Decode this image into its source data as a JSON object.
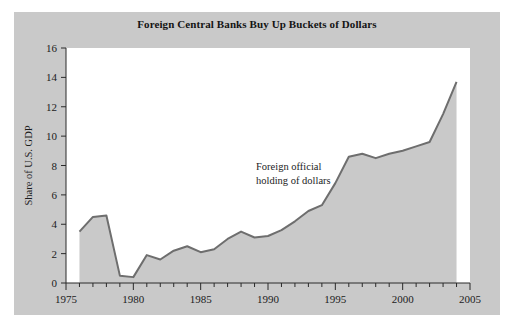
{
  "panel": {
    "background_color": "#c9c9c9",
    "plot_background_color": "#ffffff"
  },
  "title": "Foreign Central Banks Buy Up Buckets of Dollars",
  "annotation_line1": "Foreign official",
  "annotation_line2": "holding of dollars",
  "chart_data": {
    "type": "area",
    "title": "Foreign Central Banks Buy Up Buckets of Dollars",
    "xlabel": "",
    "ylabel": "Share of U.S. GDP",
    "xlim": [
      1975,
      2005
    ],
    "ylim": [
      0,
      16
    ],
    "grid": false,
    "legend": "none",
    "annotations": [
      {
        "text": "Foreign official holding of dollars",
        "x": 1991,
        "y": 7.0
      }
    ],
    "x_ticks_major": [
      1975,
      1980,
      1985,
      1990,
      1995,
      2000,
      2005
    ],
    "x_ticks_minor_step": 1,
    "y_ticks": [
      0,
      2,
      4,
      6,
      8,
      10,
      12,
      14,
      16
    ],
    "series": [
      {
        "name": "Foreign official holding of dollars",
        "fill_color": "#c9c9c9",
        "line_color": "#6e6e6e",
        "x": [
          1976,
          1977,
          1978,
          1979,
          1980,
          1981,
          1982,
          1983,
          1984,
          1985,
          1986,
          1987,
          1988,
          1989,
          1990,
          1991,
          1992,
          1993,
          1994,
          1995,
          1996,
          1997,
          1998,
          1999,
          2000,
          2001,
          2002,
          2003,
          2004
        ],
        "values": [
          3.5,
          4.5,
          4.6,
          0.5,
          0.4,
          1.9,
          1.6,
          2.2,
          2.5,
          2.1,
          2.3,
          3.0,
          3.5,
          3.1,
          3.2,
          3.6,
          4.2,
          4.9,
          5.3,
          6.8,
          8.6,
          8.8,
          8.5,
          8.8,
          9.0,
          9.3,
          9.6,
          11.5,
          13.7
        ]
      }
    ]
  }
}
